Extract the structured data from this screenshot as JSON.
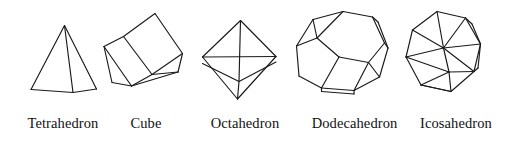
{
  "figure": {
    "background_color": "#ffffff",
    "stroke_color": "#1a1a1a",
    "width": 508,
    "height": 144
  },
  "solids": [
    {
      "id": "tetrahedron",
      "label": "Tetrahedron",
      "faces": 4,
      "face_shape": "triangle",
      "vertices": 4,
      "edges": 6
    },
    {
      "id": "cube",
      "label": "Cube",
      "faces": 6,
      "face_shape": "square",
      "vertices": 8,
      "edges": 12
    },
    {
      "id": "octahedron",
      "label": "Octahedron",
      "faces": 8,
      "face_shape": "triangle",
      "vertices": 6,
      "edges": 12
    },
    {
      "id": "dodecahedron",
      "label": "Dodecahedron",
      "faces": 12,
      "face_shape": "pentagon",
      "vertices": 20,
      "edges": 30
    },
    {
      "id": "icosahedron",
      "label": "Icosahedron",
      "faces": 20,
      "face_shape": "triangle",
      "vertices": 12,
      "edges": 30
    }
  ],
  "geometry": {
    "tetrahedron_paths": [
      "M64.5,25.5 L31,89.5",
      "M64.5,25.5 L96.5,89",
      "M64.5,25.5 L73,92.5",
      "M31,89.5 L73,92.5",
      "M73,92.5 L96.5,89"
    ],
    "cube_paths": [
      "M155,13.5 L182.5,53.5",
      "M182.5,53.5 L152,74.5",
      "M152,74.5 L123.5,36.5",
      "M123.5,36.5 L155,13.5",
      "M123.5,36.5 L104,46.5",
      "M104,46.5 L131.5,86",
      "M131.5,86 L152,74.5",
      "M104,46.5 L112,82.5",
      "M112,82.5 L131.5,86",
      "M182.5,53.5 L178,72",
      "M178,72 L131.5,86",
      "M178,72 L152,74.5"
    ],
    "octahedron_paths": [
      "M240.5,20.5 L202.5,57",
      "M240.5,20.5 L276,56.5",
      "M240.5,20.5 L239,81.5",
      "M202.5,57 L276,56.5",
      "M202.5,57 L237.5,99",
      "M276,56.5 L237.5,99",
      "M239,81.5 L237.5,99",
      "M202.5,57 L239,81.5",
      "M276,56.5 L239,81.5",
      "M202.5,63.5 L239,81.5",
      "M276,62 L239,81.5"
    ],
    "dodecahedron_paths": [
      "M343,11.5 L372.5,17",
      "M372.5,17 L384.5,43",
      "M384.5,43 L368.5,62.5",
      "M368.5,62.5 L339,57",
      "M339,57 L317,38",
      "M317,38 L343,11.5",
      "M343,11.5 L313,19.5",
      "M313,19.5 L317,38",
      "M313,19.5 L296.5,46",
      "M296.5,46 L317,38",
      "M296.5,46 L299,76",
      "M299,76 L321.5,88",
      "M321.5,88 L339,57",
      "M299,76 L321.5,88",
      "M321.5,88 L354,90.5",
      "M354,90.5 L368.5,62.5",
      "M354,90.5 L379.5,77",
      "M379.5,77 L368.5,62.5",
      "M379.5,77 L388,48",
      "M388,48 L384.5,43",
      "M372.5,17 L378,22",
      "M378,22 L388,48",
      "M321.5,91.5 L354,94",
      "M354,94 L354,90.5",
      "M321.5,91.5 L321.5,88"
    ],
    "icosahedron_paths": [
      "M437,11.5 L465.5,18",
      "M465.5,18 L480.5,44",
      "M480.5,44 L474,71.5",
      "M474,71.5 L451,91.5",
      "M451,91.5 L421,85",
      "M421,85 L406,57",
      "M406,57 L412.5,30",
      "M412.5,30 L437,11.5",
      "M437,11.5 L443.5,48",
      "M465.5,18 L443.5,48",
      "M480.5,44 L443.5,48",
      "M412.5,30 L443.5,48",
      "M406,57 L443.5,48",
      "M443.5,48 L449,72",
      "M449,72 L421,85",
      "M449,72 L451,91.5",
      "M449,72 L474,71.5",
      "M406,57 L449,72",
      "M480.5,44 L474,71.5",
      "M443.5,48 L474,71.5",
      "M421,85 L451,91.5",
      "M465.5,18 L472,24",
      "M472,24 L480.5,44",
      "M474,71.5 L478,68",
      "M478,68 L480.5,44"
    ]
  }
}
